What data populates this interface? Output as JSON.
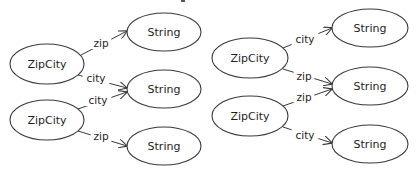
{
  "diagrams": [
    {
      "id": "left",
      "nodes": [
        {
          "key": "zc1",
          "label": "ZipCity",
          "type": "ZipCity",
          "cx": 47,
          "cy": 64,
          "rx": 37,
          "ry": 20
        },
        {
          "key": "zc2",
          "label": "ZipCity",
          "type": "ZipCity",
          "cx": 47,
          "cy": 120,
          "rx": 37,
          "ry": 20
        },
        {
          "key": "s1",
          "label": "String",
          "type": "String",
          "cx": 164,
          "cy": 32,
          "rx": 37,
          "ry": 19
        },
        {
          "key": "s2",
          "label": "String",
          "type": "String",
          "cx": 164,
          "cy": 89,
          "rx": 37,
          "ry": 19
        },
        {
          "key": "s3",
          "label": "String",
          "type": "String",
          "cx": 164,
          "cy": 146,
          "rx": 37,
          "ry": 19
        }
      ],
      "edges": [
        {
          "from": "zc1",
          "to": "s1",
          "label": "zip",
          "x1": 81,
          "y1": 55,
          "x2": 127,
          "y2": 31,
          "lx": 101,
          "ly": 43
        },
        {
          "from": "zc1",
          "to": "s2",
          "label": "city",
          "x1": 78,
          "y1": 75,
          "x2": 127,
          "y2": 88,
          "lx": 96,
          "ly": 78
        },
        {
          "from": "zc2",
          "to": "s2",
          "label": "city",
          "x1": 78,
          "y1": 109,
          "x2": 127,
          "y2": 92,
          "lx": 98,
          "ly": 100
        },
        {
          "from": "zc2",
          "to": "s3",
          "label": "zip",
          "x1": 78,
          "y1": 131,
          "x2": 127,
          "y2": 146,
          "lx": 101,
          "ly": 136
        }
      ]
    },
    {
      "id": "right",
      "nodes": [
        {
          "key": "zc1",
          "label": "ZipCity",
          "type": "ZipCity",
          "cx": 250,
          "cy": 58,
          "rx": 38,
          "ry": 20
        },
        {
          "key": "zc2",
          "label": "ZipCity",
          "type": "ZipCity",
          "cx": 250,
          "cy": 116,
          "rx": 38,
          "ry": 20
        },
        {
          "key": "s1",
          "label": "String",
          "type": "String",
          "cx": 370,
          "cy": 28,
          "rx": 38,
          "ry": 19
        },
        {
          "key": "s2",
          "label": "String",
          "type": "String",
          "cx": 370,
          "cy": 86,
          "rx": 38,
          "ry": 19
        },
        {
          "key": "s3",
          "label": "String",
          "type": "String",
          "cx": 370,
          "cy": 144,
          "rx": 38,
          "ry": 19
        }
      ],
      "edges": [
        {
          "from": "zc1",
          "to": "s1",
          "label": "city",
          "x1": 283,
          "y1": 48,
          "x2": 332,
          "y2": 28,
          "lx": 305,
          "ly": 39
        },
        {
          "from": "zc1",
          "to": "s2",
          "label": "zip",
          "x1": 283,
          "y1": 69,
          "x2": 332,
          "y2": 84,
          "lx": 304,
          "ly": 76
        },
        {
          "from": "zc2",
          "to": "s2",
          "label": "zip",
          "x1": 283,
          "y1": 106,
          "x2": 332,
          "y2": 89,
          "lx": 304,
          "ly": 97
        },
        {
          "from": "zc2",
          "to": "s3",
          "label": "city",
          "x1": 283,
          "y1": 127,
          "x2": 332,
          "y2": 143,
          "lx": 305,
          "ly": 135
        }
      ]
    }
  ],
  "legend": {
    "node_types": [
      "ZipCity",
      "String"
    ],
    "edge_labels": [
      "zip",
      "city"
    ]
  },
  "style": {
    "stroke": "#3a3a3a",
    "text": "#1e1e1e",
    "background": "#ffffff"
  }
}
